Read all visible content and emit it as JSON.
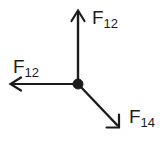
{
  "diagram": {
    "name": "force-vector-diagram",
    "type": "free-body-force-diagram",
    "background_color": "#ffffff",
    "ink_color": "#1c1c1c",
    "width": 165,
    "height": 143,
    "node": {
      "label": "",
      "x": 78,
      "y": 84,
      "radius": 4.5
    },
    "vectors": [
      {
        "id": "force-up",
        "label_base": "F",
        "label_subscript": "12",
        "label_text": "F12",
        "direction": "up",
        "from_x": 78,
        "from_y": 84,
        "to_x": 78,
        "to_y": 11,
        "angle_deg": 90,
        "arrowhead": "open-v"
      },
      {
        "id": "force-left",
        "label_base": "F",
        "label_subscript": "12",
        "label_text": "F12",
        "direction": "left",
        "from_x": 78,
        "from_y": 84,
        "to_x": 11,
        "to_y": 84,
        "angle_deg": 180,
        "arrowhead": "open-v"
      },
      {
        "id": "force-diagonal",
        "label_base": "F",
        "label_subscript": "14",
        "label_text": "F14",
        "direction": "down-right",
        "from_x": 79,
        "from_y": 86,
        "to_x": 119,
        "to_y": 127,
        "angle_deg": -45,
        "arrowhead": "open-v"
      }
    ],
    "labels": {
      "up": {
        "base": "F",
        "sub": "12"
      },
      "left": {
        "base": "F",
        "sub": "12"
      },
      "diagonal": {
        "base": "F",
        "sub": "14"
      }
    }
  }
}
